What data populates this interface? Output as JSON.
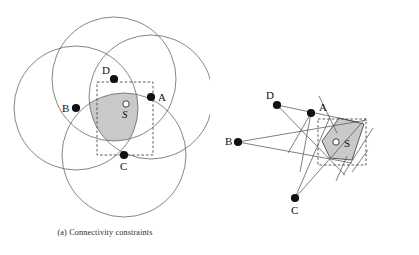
{
  "figure": {
    "title": "",
    "panels": [
      {
        "id": "a",
        "caption": "(a)  Connectivity constraints",
        "kind": "connectivity",
        "anchors": [
          {
            "label": "A",
            "x": 151,
            "y": 97,
            "label_dx": 7,
            "label_dy": 4
          },
          {
            "label": "B",
            "x": 76,
            "y": 108,
            "label_dx": -14,
            "label_dy": 3.5
          },
          {
            "label": "C",
            "x": 124,
            "y": 155,
            "label_dx": -4,
            "label_dy": 15
          },
          {
            "label": "D",
            "x": 114,
            "y": 79,
            "label_dx": -12,
            "label_dy": -5
          }
        ],
        "target": {
          "label": "S",
          "x": 127,
          "y": 113,
          "marker_dx": -1,
          "marker_dy": -9,
          "marker_r": 3.2
        },
        "circles": [
          {
            "anchor": "A",
            "cx": 151,
            "cy": 97,
            "r": 62
          },
          {
            "anchor": "B",
            "cx": 76,
            "cy": 108,
            "r": 62
          },
          {
            "anchor": "C",
            "cx": 124,
            "cy": 155,
            "r": 62
          },
          {
            "anchor": "D",
            "cx": 114,
            "cy": 79,
            "r": 62
          }
        ],
        "bounding_box": {
          "x": 97,
          "y": 82,
          "width": 56,
          "height": 73
        },
        "region_description": "intersection-lens-of-four-circles"
      },
      {
        "id": "b",
        "caption": "(b)  Angular constraints",
        "kind": "angular",
        "anchors": [
          {
            "label": "A",
            "x": 311,
            "y": 113,
            "label_dx": 8,
            "label_dy": -2
          },
          {
            "label": "B",
            "x": 238,
            "y": 142,
            "label_dx": -13,
            "label_dy": 3
          },
          {
            "label": "C",
            "x": 295,
            "y": 198,
            "label_dx": -3,
            "label_dy": 16
          },
          {
            "label": "D",
            "x": 277,
            "y": 105,
            "label_dx": -11,
            "label_dy": -6
          }
        ],
        "target": {
          "label": "S",
          "x": 350,
          "y": 143,
          "marker_dx": -14,
          "marker_dy": -1,
          "marker_r": 3.2
        },
        "bounding_box": {
          "x": 318,
          "y": 119,
          "width": 48,
          "height": 46
        },
        "region_vertices": [
          [
            322,
            141
          ],
          [
            339,
            118
          ],
          [
            364,
            124
          ],
          [
            352,
            160
          ],
          [
            330,
            158
          ]
        ],
        "region_description": "polygon-intersection-of-angular-wedges"
      }
    ],
    "colors": {
      "background": "#ffffff",
      "stroke": "#555555",
      "node": "#111111",
      "region_fill": "#c9c9c9",
      "region_stroke": "#4a4a4a",
      "dashed_box": "#4a4a4a",
      "caption_text": "#2b2b2b"
    }
  }
}
